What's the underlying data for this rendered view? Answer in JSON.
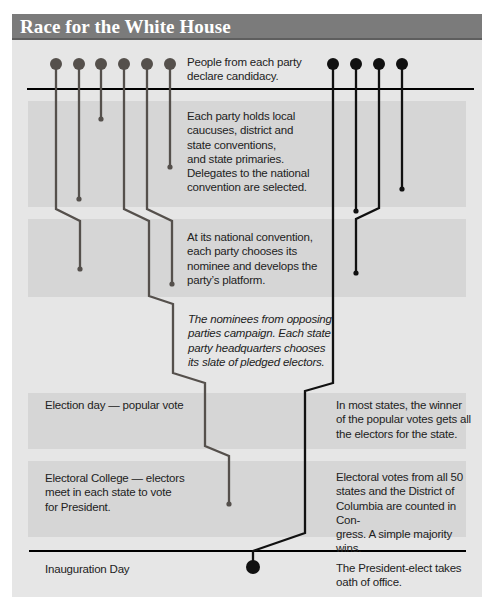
{
  "title": "Race for the White House",
  "colors": {
    "title_bar": "#7b7b7b",
    "title_text": "#ffffff",
    "panel_bg": "#e6e6e6",
    "band_bg": "#d6d6d6",
    "party_left": "#55504c",
    "party_right": "#111111",
    "rule": "#000000"
  },
  "stages": [
    {
      "id": "declare",
      "text": "People from each party declare candidacy."
    },
    {
      "id": "local",
      "text": "Each party holds local caucuses, district and state conventions, and state primaries. Delegates to the national convention are selected."
    },
    {
      "id": "national",
      "text": "At its national convention, each party chooses its nominee and develops the party’s platform."
    },
    {
      "id": "campaign",
      "text": "The nominees from opposing parties campaign. Each state party headquarters chooses its slate of pledged electors."
    },
    {
      "id": "election_left",
      "text": "Election day — popular vote"
    },
    {
      "id": "election_right",
      "text": "In most states, the winner of the popular votes gets all the electors for the state."
    },
    {
      "id": "college_left",
      "text": "Electoral College — electors meet in each state to vote for President."
    },
    {
      "id": "college_right",
      "text": "Electoral votes from all 50 states and the District of Columbia are counted in Congress. A simple majority wins."
    },
    {
      "id": "inauguration_left",
      "text": "Inauguration Day"
    },
    {
      "id": "inauguration_right",
      "text": "The President-elect takes oath of office."
    }
  ],
  "text_lines": {
    "declare": [
      "People from each party",
      "declare candidacy."
    ],
    "local": [
      "Each party holds local",
      "caucuses, district and",
      "state conventions,",
      "and state primaries.",
      "Delegates to the national",
      "convention are selected."
    ],
    "national": [
      "At its national convention,",
      "each party chooses its",
      "nominee and develops the",
      "party’s platform."
    ],
    "campaign": [
      "The nominees from opposing",
      "parties campaign. Each state",
      "party headquarters chooses",
      "its slate of pledged electors."
    ],
    "election_left": [
      "Election day — popular vote"
    ],
    "election_right": [
      "In most states, the winner",
      "of the popular votes gets all",
      "the electors for the state."
    ],
    "college_left": [
      "Electoral College — electors",
      "meet in each state to vote",
      "for President."
    ],
    "college_right": [
      "Electoral votes from all 50",
      "states and the District of",
      "Columbia are counted in Con-",
      "gress. A simple majority wins."
    ],
    "inauguration_left": [
      "Inauguration Day"
    ],
    "inauguration_right": [
      "The President-elect takes",
      "oath of office."
    ]
  },
  "parties": {
    "left_candidates": 6,
    "right_candidates": 4
  }
}
